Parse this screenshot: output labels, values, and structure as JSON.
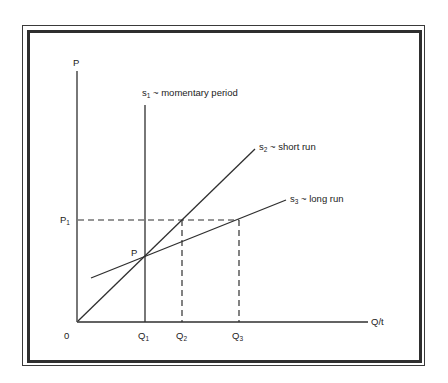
{
  "diagram": {
    "type": "supply curves by time period",
    "axes": {
      "y_label": "P",
      "x_label": "Q/t",
      "origin_label": "0"
    },
    "price_labels": {
      "p1_base": "P",
      "p1_sub": "1",
      "p_point": "P"
    },
    "quantity_labels": [
      {
        "base": "Q",
        "sub": "1"
      },
      {
        "base": "Q",
        "sub": "2"
      },
      {
        "base": "Q",
        "sub": "3"
      }
    ],
    "curves": [
      {
        "id": "s1",
        "base": "s",
        "sub": "1",
        "desc": " ~ momentary period"
      },
      {
        "id": "s2",
        "base": "s",
        "sub": "2",
        "desc": " ~ short run"
      },
      {
        "id": "s3",
        "base": "s",
        "sub": "3",
        "desc": " ~ long run"
      }
    ],
    "colors": {
      "line": "#2f2f2f",
      "background": "#ffffff"
    }
  }
}
